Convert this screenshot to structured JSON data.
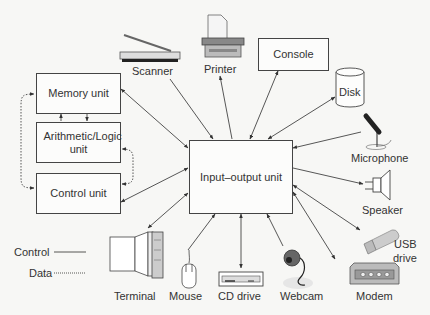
{
  "diagram": {
    "cpu_units": [
      {
        "id": "memory",
        "label": "Memory unit"
      },
      {
        "id": "alu",
        "label": "Arithmetic/Logic unit"
      },
      {
        "id": "control",
        "label": "Control unit"
      }
    ],
    "hub": {
      "id": "io",
      "label": "Input–output unit"
    },
    "peripherals": [
      {
        "id": "scanner",
        "label": "Scanner",
        "icon": "scanner-icon"
      },
      {
        "id": "printer",
        "label": "Printer",
        "icon": "printer-icon"
      },
      {
        "id": "console",
        "label": "Console",
        "icon": "box"
      },
      {
        "id": "disk",
        "label": "Disk",
        "icon": "disk-cylinder-icon"
      },
      {
        "id": "microphone",
        "label": "Microphone",
        "icon": "microphone-icon"
      },
      {
        "id": "speaker",
        "label": "Speaker",
        "icon": "speaker-icon"
      },
      {
        "id": "usb",
        "label_line1": "USB",
        "label_line2": "drive",
        "icon": "usb-drive-icon"
      },
      {
        "id": "modem",
        "label": "Modem",
        "icon": "modem-icon"
      },
      {
        "id": "webcam",
        "label": "Webcam",
        "icon": "webcam-icon"
      },
      {
        "id": "cd",
        "label": "CD drive",
        "icon": "cd-drive-icon"
      },
      {
        "id": "mouse",
        "label": "Mouse",
        "icon": "mouse-icon"
      },
      {
        "id": "terminal",
        "label": "Terminal",
        "icon": "terminal-icon"
      }
    ],
    "legend": {
      "control": "Control",
      "data": "Data"
    },
    "colors": {
      "line": "#444444",
      "box_border": "#444444",
      "background": "#f7f7f5"
    }
  }
}
